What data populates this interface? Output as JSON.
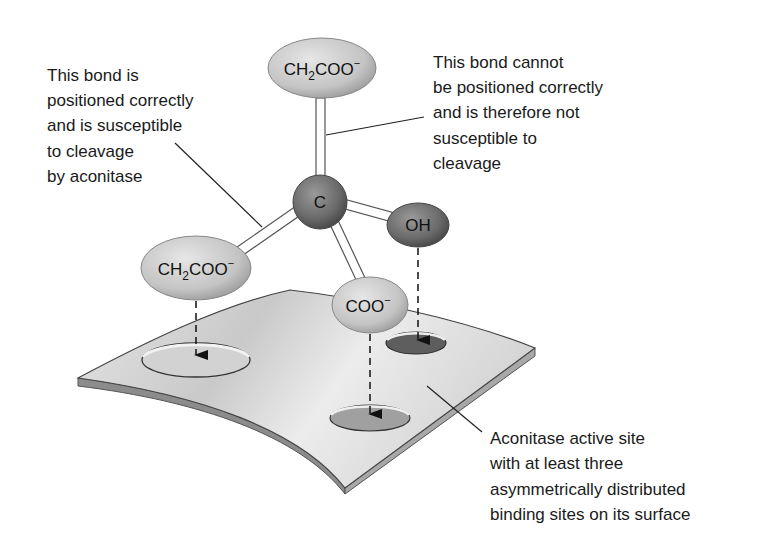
{
  "figure": {
    "annotations": {
      "left_bond": {
        "lines": [
          "This bond is",
          "positioned correctly",
          "and is susceptible",
          "to cleavage",
          "by aconitase"
        ]
      },
      "top_bond": {
        "lines": [
          "This bond cannot",
          "be positioned correctly",
          "and is therefore not",
          "susceptible to",
          "cleavage"
        ]
      },
      "active_site": {
        "lines": [
          "Aconitase active site",
          "with at least three",
          "asymmetrically distributed",
          "binding sites on its surface"
        ]
      }
    },
    "atoms": {
      "center": "C",
      "top_group": {
        "main": "CH",
        "sub": "2",
        "rest": "COO",
        "charge": "−"
      },
      "left_group": {
        "main": "CH",
        "sub": "2",
        "rest": "COO",
        "charge": "−"
      },
      "carboxylate": {
        "main": "COO",
        "charge": "−"
      },
      "hydroxyl": "OH"
    },
    "colors": {
      "light_group": "#c8c8c8",
      "dark_group": "#6e6e6e",
      "surface": "#d9d9d9",
      "surface_edge": "#8c8c8c",
      "text": "#1a1a1a"
    }
  }
}
